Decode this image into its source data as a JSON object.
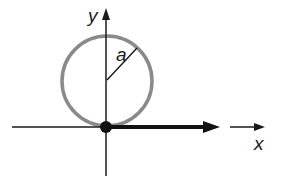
{
  "diagram": {
    "labels": {
      "y_axis": "y",
      "x_axis": "x",
      "radius": "a"
    },
    "colors": {
      "circle": "#8a8a8a",
      "axes": "#1a1a1a",
      "vector": "#111111",
      "background": "#ffffff"
    }
  }
}
